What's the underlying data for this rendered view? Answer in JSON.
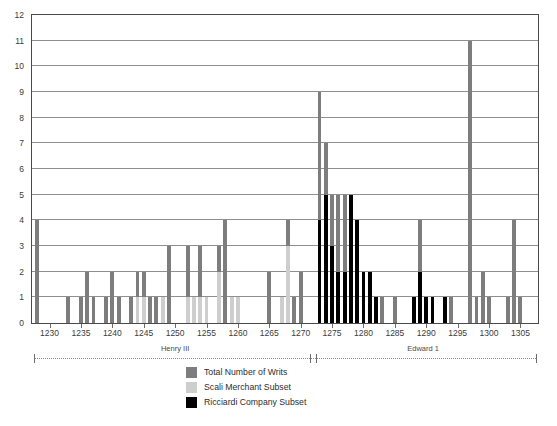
{
  "chart_data": {
    "type": "bar",
    "title": "",
    "subtitle": "",
    "xlabel": "",
    "ylabel": "",
    "ylim": [
      0,
      12
    ],
    "ytick_values": [
      0,
      1,
      2,
      3,
      4,
      5,
      6,
      7,
      8,
      9,
      10,
      11,
      12
    ],
    "ytick_labels": [
      "0",
      "1",
      "2",
      "3",
      "4",
      "5",
      "6",
      "7",
      "8",
      "9",
      "10",
      "11",
      "12"
    ],
    "grid": true,
    "grid_axis": "y",
    "xlim": [
      1227.2,
      1307.8
    ],
    "xtick_values": [
      1230,
      1235,
      1240,
      1245,
      1250,
      1255,
      1260,
      1265,
      1270,
      1275,
      1280,
      1285,
      1290,
      1295,
      1300,
      1305
    ],
    "xtick_labels": [
      "1230",
      "1235",
      "1240",
      "1245",
      "1250",
      "1255",
      "1260",
      "1265",
      "1270",
      "1275",
      "1280",
      "1285",
      "1290",
      "1295",
      "1300",
      "1305"
    ],
    "legend_position": "bottom-center",
    "series": [
      {
        "name": "Total Number of Writs",
        "color": "#7d7d7d",
        "key": "total"
      },
      {
        "name": "Scali Merchant Subset",
        "color": "#cecece",
        "key": "scali"
      },
      {
        "name": "Ricciardi Company Subset",
        "color": "#000000",
        "key": "ricciardi"
      }
    ],
    "overlap_mode": "overlaid",
    "years": [
      1228,
      1229,
      1230,
      1231,
      1232,
      1233,
      1234,
      1235,
      1236,
      1237,
      1238,
      1239,
      1240,
      1241,
      1242,
      1243,
      1244,
      1245,
      1246,
      1247,
      1248,
      1249,
      1250,
      1251,
      1252,
      1253,
      1254,
      1255,
      1256,
      1257,
      1258,
      1259,
      1260,
      1261,
      1262,
      1263,
      1264,
      1265,
      1266,
      1267,
      1268,
      1269,
      1270,
      1271,
      1272,
      1273,
      1274,
      1275,
      1276,
      1277,
      1278,
      1279,
      1280,
      1281,
      1282,
      1283,
      1284,
      1285,
      1286,
      1287,
      1288,
      1289,
      1290,
      1291,
      1292,
      1293,
      1294,
      1295,
      1296,
      1297,
      1298,
      1299,
      1300,
      1301,
      1302,
      1303,
      1304,
      1305,
      1306,
      1307
    ],
    "total": [
      4,
      0,
      0,
      0,
      0,
      1,
      0,
      1,
      2,
      1,
      0,
      1,
      2,
      1,
      0,
      1,
      2,
      2,
      1,
      1,
      1,
      3,
      0,
      0,
      3,
      1,
      3,
      1,
      0,
      3,
      4,
      1,
      1,
      0,
      0,
      0,
      0,
      2,
      0,
      1,
      4,
      1,
      2,
      0,
      0,
      9,
      7,
      5,
      5,
      5,
      4,
      2,
      2,
      1,
      0,
      1,
      0,
      1,
      0,
      0,
      1,
      4,
      1,
      0,
      0,
      0,
      1,
      0,
      0,
      11,
      1,
      2,
      1,
      0,
      0,
      1,
      4,
      1,
      0,
      0
    ],
    "scali": [
      0,
      0,
      0,
      0,
      0,
      0,
      0,
      0,
      0,
      0,
      0,
      0,
      0,
      0,
      0,
      0,
      1,
      1,
      0,
      0,
      1,
      0,
      0,
      0,
      1,
      1,
      1,
      1,
      0,
      2,
      0,
      1,
      1,
      0,
      0,
      0,
      0,
      0,
      0,
      1,
      3,
      0,
      0,
      0,
      0,
      0,
      0,
      0,
      0,
      0,
      0,
      0,
      0,
      0,
      0,
      0,
      0,
      0,
      0,
      0,
      0,
      0,
      0,
      0,
      0,
      0,
      0,
      0,
      0,
      0,
      0,
      0,
      0,
      0,
      0,
      0,
      0,
      0,
      0,
      0
    ],
    "ricciardi": [
      0,
      0,
      0,
      0,
      0,
      0,
      0,
      0,
      0,
      0,
      0,
      0,
      0,
      0,
      0,
      0,
      0,
      0,
      0,
      0,
      0,
      0,
      0,
      0,
      0,
      0,
      0,
      0,
      0,
      0,
      0,
      0,
      0,
      0,
      0,
      0,
      0,
      0,
      0,
      0,
      0,
      0,
      0,
      0,
      0,
      4,
      5,
      3,
      2,
      2,
      5,
      4,
      2,
      2,
      1,
      0,
      0,
      0,
      0,
      0,
      1,
      2,
      1,
      1,
      0,
      1,
      0,
      0,
      0,
      0,
      0,
      0,
      0,
      0,
      0,
      0,
      0,
      0,
      0,
      0
    ],
    "annotations": [
      {
        "text": "Henry III",
        "type": "reign-bracket",
        "start_year": 1228,
        "end_year": 1272
      },
      {
        "text": "Edward 1",
        "type": "reign-bracket",
        "start_year": 1272,
        "end_year": 1307
      }
    ]
  },
  "legend": {
    "items": [
      {
        "label": "Total Number of Writs",
        "color": "#7d7d7d"
      },
      {
        "label": "Scali Merchant Subset",
        "color": "#cecece"
      },
      {
        "label": "Ricciardi Company Subset",
        "color": "#000000"
      }
    ]
  },
  "reigns": [
    {
      "label": "Henry III"
    },
    {
      "label": "Edward 1"
    }
  ]
}
